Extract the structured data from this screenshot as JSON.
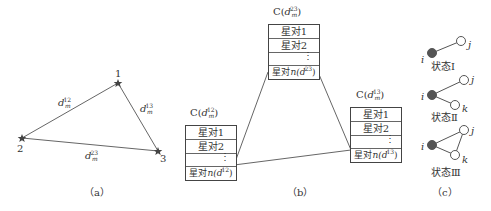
{
  "panel_a": {
    "caption": "（a）",
    "stars": [
      {
        "label": "1",
        "x": 118,
        "y": 83
      },
      {
        "label": "2",
        "x": 22,
        "y": 138
      },
      {
        "label": "3",
        "x": 158,
        "y": 151
      }
    ],
    "edges": [
      {
        "var": "d",
        "sub": "m",
        "sup": "12"
      },
      {
        "var": "d",
        "sub": "m",
        "sup": "13"
      },
      {
        "var": "d",
        "sub": "m",
        "sup": "23"
      }
    ]
  },
  "panel_b": {
    "caption": "（b）",
    "boxes": [
      {
        "id": "12",
        "header_prefix": "C(",
        "header_var": "d",
        "header_sub": "m",
        "header_sup": "12",
        "header_suffix": ")",
        "rows": [
          "星对1",
          "星对2",
          "⋮"
        ],
        "last_row_prefix": "星对",
        "last_row_func": "n(",
        "last_row_sup": "12",
        "last_row_suffix": ")"
      },
      {
        "id": "23",
        "header_prefix": "C(",
        "header_var": "d",
        "header_sub": "m",
        "header_sup": "23",
        "header_suffix": ")",
        "rows": [
          "星对1",
          "星对2",
          "⋮"
        ],
        "last_row_prefix": "星对",
        "last_row_func": "n(",
        "last_row_sup": "23",
        "last_row_suffix": ")"
      },
      {
        "id": "13",
        "header_prefix": "C(",
        "header_var": "d",
        "header_sub": "m",
        "header_sup": "13",
        "header_suffix": ")",
        "rows": [
          "星对1",
          "星对2",
          "⋮"
        ],
        "last_row_prefix": "星对",
        "last_row_func": "n(",
        "last_row_sup": "13",
        "last_row_suffix": ")"
      }
    ]
  },
  "panel_c": {
    "caption": "（c）",
    "states": [
      {
        "label": "状态Ⅰ",
        "nodes": [
          "i",
          "j"
        ]
      },
      {
        "label": "状态Ⅱ",
        "nodes": [
          "i",
          "j",
          "k"
        ]
      },
      {
        "label": "状态Ⅲ",
        "nodes": [
          "i",
          "j",
          "k"
        ]
      }
    ]
  },
  "colors": {
    "line": "#555555",
    "filled_node": "#555555",
    "hollow_node": "#ffffff",
    "text": "#333333"
  }
}
